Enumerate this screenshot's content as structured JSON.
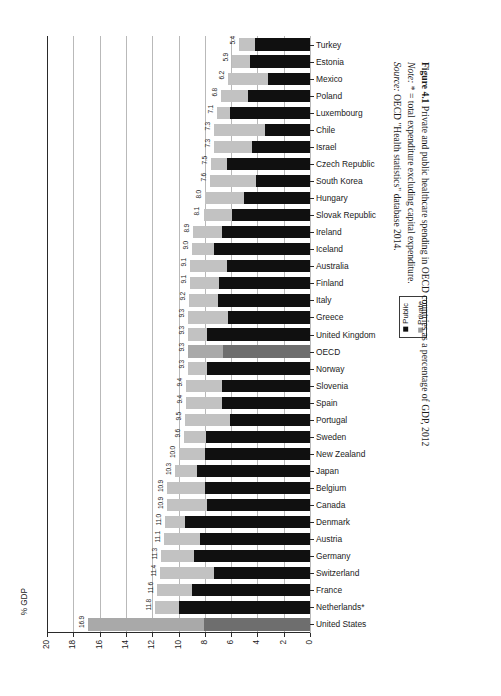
{
  "figure": {
    "number": "Figure 4.1",
    "title": "Private and public healthcare spending in OECD countries as a percentage of GDP, 2012",
    "note_label": "Note:",
    "note_text": "* = total expenditure excluding capital expenditure.",
    "source_label": "Source:",
    "source_text": "OECD \"Health statistics\" database 2014."
  },
  "legend": {
    "position": "right",
    "items": [
      {
        "label": "Public",
        "color": "#101010",
        "icon": "square-swatch"
      },
      {
        "label": "Private",
        "color": "#9c9c9c",
        "icon": "square-swatch"
      }
    ]
  },
  "axis": {
    "y_axis_label": "% GDP",
    "x_ticks": [
      "20",
      "18",
      "16",
      "14",
      "12",
      "10",
      "8",
      "6",
      "4",
      "2",
      "0"
    ]
  },
  "chart_data": {
    "type": "bar",
    "orientation": "horizontal",
    "stacked": true,
    "title": "Private and public healthcare spending in OECD countries as a percentage of GDP, 2012",
    "xlabel": "% GDP",
    "ylabel": "",
    "xlim": [
      20,
      0
    ],
    "x_reversed": true,
    "grid": true,
    "legend_position": "right",
    "series": [
      {
        "name": "Public",
        "color": "#101010"
      },
      {
        "name": "Private",
        "color": "#c2c2c2"
      }
    ],
    "categories": [
      "Turkey",
      "Estonia",
      "Mexico",
      "Poland",
      "Luxembourg",
      "Chile",
      "Israel",
      "Czech Republic",
      "South Korea",
      "Hungary",
      "Slovak Republic",
      "Ireland",
      "Iceland",
      "Australia",
      "Finland",
      "Italy",
      "Greece",
      "United Kingdom",
      "OECD",
      "Norway",
      "Slovenia",
      "Spain",
      "Portugal",
      "Sweden",
      "New Zealand",
      "Japan",
      "Belgium",
      "Canada",
      "Denmark",
      "Austria",
      "Germany",
      "Switzerland",
      "France",
      "Netherlands*",
      "United States"
    ],
    "totals": [
      5.4,
      5.9,
      6.2,
      6.8,
      7.1,
      7.3,
      7.3,
      7.5,
      7.6,
      8.0,
      8.1,
      8.9,
      9.0,
      9.1,
      9.1,
      9.2,
      9.3,
      9.3,
      9.3,
      9.3,
      9.4,
      9.4,
      9.5,
      9.6,
      10.0,
      10.3,
      10.9,
      10.9,
      11.0,
      11.1,
      11.3,
      11.4,
      11.6,
      11.8,
      16.9
    ],
    "public": [
      4.2,
      4.6,
      3.2,
      4.7,
      6.1,
      3.4,
      4.4,
      6.3,
      4.1,
      5.0,
      5.9,
      6.7,
      7.3,
      6.3,
      6.9,
      7.0,
      6.2,
      7.8,
      6.6,
      7.8,
      6.7,
      6.7,
      6.1,
      7.9,
      8.0,
      8.6,
      8.0,
      7.8,
      9.5,
      8.4,
      8.8,
      7.3,
      9.0,
      10.0,
      8.1
    ],
    "private": [
      1.2,
      1.3,
      3.0,
      2.1,
      1.0,
      3.9,
      2.9,
      1.2,
      3.5,
      3.0,
      2.2,
      2.2,
      1.7,
      2.8,
      2.2,
      2.2,
      3.1,
      1.5,
      2.7,
      1.5,
      2.7,
      2.7,
      3.4,
      1.7,
      2.0,
      1.7,
      2.9,
      3.1,
      1.5,
      2.7,
      2.5,
      4.1,
      2.6,
      1.8,
      8.8
    ],
    "highlighted": [
      "OECD",
      "United States"
    ],
    "data_labels": [
      "5.4",
      "5.9",
      "6.2",
      "6.8",
      "7.1",
      "7.3",
      "7.3",
      "7.5",
      "7.6",
      "8.0",
      "8.1",
      "8.9",
      "9.0",
      "9.1",
      "9.1",
      "9.2",
      "9.3",
      "9.3",
      "9.3",
      "9.3",
      "9.4",
      "9.4",
      "9.5",
      "9.6",
      "10.0",
      "10.3",
      "10.9",
      "10.9",
      "11.0",
      "11.1",
      "11.3",
      "11.4",
      "11.6",
      "11.8",
      "16.9"
    ]
  }
}
